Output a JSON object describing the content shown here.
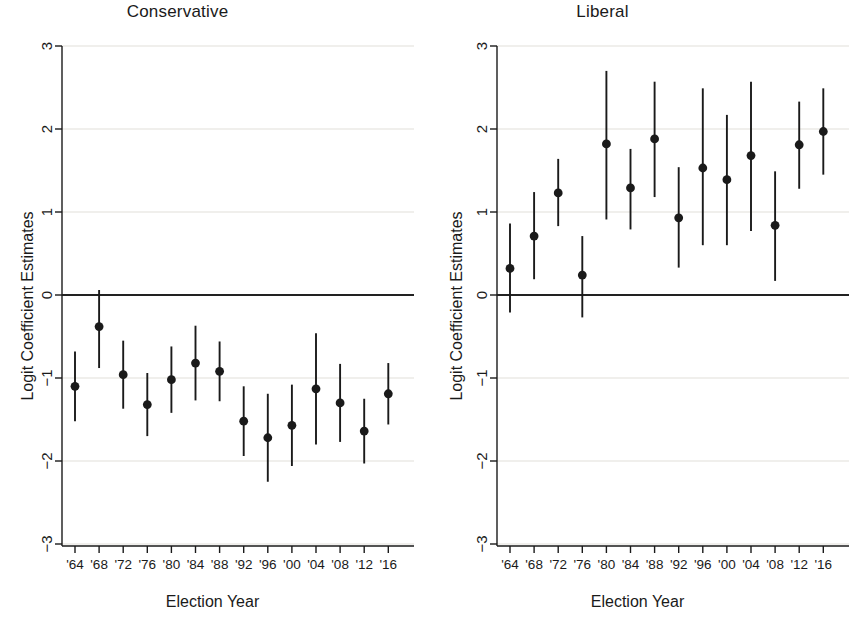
{
  "figure": {
    "background": "#ffffff",
    "ink": "#1a1a1a",
    "gridline_color": "#e2e0da",
    "zeroline_color": "#222222"
  },
  "panels": [
    {
      "key": "conservative",
      "title": "Conservative",
      "xlabel": "Election Year",
      "ylabel": "Logit Coefficient Estimates"
    },
    {
      "key": "liberal",
      "title": "Liberal",
      "xlabel": "Election Year",
      "ylabel": "Logit Coefficient Estimates"
    }
  ],
  "axis": {
    "y_ticks": [
      "3",
      "2",
      "1",
      "0",
      "-1",
      "-2",
      "-3"
    ],
    "x_ticks": [
      "'64",
      "'68",
      "'72",
      "'76",
      "'80",
      "'84",
      "'88",
      "'92",
      "'96",
      "'00",
      "'04",
      "'08",
      "'12",
      "'16"
    ]
  },
  "chart_data": [
    {
      "type": "scatter",
      "title": "Conservative",
      "xlabel": "Election Year",
      "ylabel": "Logit Coefficient Estimates",
      "categories": [
        "'64",
        "'68",
        "'72",
        "'76",
        "'80",
        "'84",
        "'88",
        "'92",
        "'96",
        "'00",
        "'04",
        "'08",
        "'12",
        "'16"
      ],
      "ylim": [
        -3,
        3
      ],
      "yticks": [
        -3,
        -2,
        -1,
        0,
        1,
        2,
        3
      ],
      "grid": true,
      "reference_line": 0,
      "legend": "none",
      "values": [
        -1.1,
        -0.38,
        -0.96,
        -1.32,
        -1.02,
        -0.82,
        -0.92,
        -1.52,
        -1.72,
        -1.57,
        -1.13,
        -1.3,
        -1.64,
        -1.19
      ],
      "ci_low": [
        -1.52,
        -0.88,
        -1.37,
        -1.7,
        -1.42,
        -1.27,
        -1.28,
        -1.94,
        -2.25,
        -2.06,
        -1.8,
        -1.77,
        -2.03,
        -1.56
      ],
      "ci_high": [
        -0.68,
        0.06,
        -0.55,
        -0.94,
        -0.62,
        -0.37,
        -0.56,
        -1.1,
        -1.19,
        -1.08,
        -0.46,
        -0.83,
        -1.25,
        -0.82
      ]
    },
    {
      "type": "scatter",
      "title": "Liberal",
      "xlabel": "Election Year",
      "ylabel": "Logit Coefficient Estimates",
      "categories": [
        "'64",
        "'68",
        "'72",
        "'76",
        "'80",
        "'84",
        "'88",
        "'92",
        "'96",
        "'00",
        "'04",
        "'08",
        "'12",
        "'16"
      ],
      "ylim": [
        -3,
        3
      ],
      "yticks": [
        -3,
        -2,
        -1,
        0,
        1,
        2,
        3
      ],
      "grid": true,
      "reference_line": 0,
      "legend": "none",
      "values": [
        0.32,
        0.71,
        1.23,
        0.24,
        1.82,
        1.29,
        1.88,
        0.93,
        1.53,
        1.39,
        1.68,
        0.84,
        1.81,
        1.97
      ],
      "ci_low": [
        -0.21,
        0.19,
        0.83,
        -0.27,
        0.91,
        0.79,
        1.18,
        0.33,
        0.6,
        0.6,
        0.77,
        0.17,
        1.28,
        1.45
      ],
      "ci_high": [
        0.86,
        1.24,
        1.64,
        0.71,
        2.7,
        1.76,
        2.57,
        1.54,
        2.49,
        2.17,
        2.57,
        1.49,
        2.33,
        2.49
      ]
    }
  ]
}
